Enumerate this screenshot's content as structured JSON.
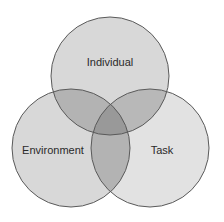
{
  "diagram": {
    "type": "venn",
    "sets": [
      {
        "id": "individual",
        "label": "Individual",
        "cx": 110,
        "cy": 76,
        "r": 59,
        "label_x": 110,
        "label_y": 66
      },
      {
        "id": "environment",
        "label": "Environment",
        "cx": 71,
        "cy": 148,
        "r": 59,
        "label_x": 53,
        "label_y": 154
      },
      {
        "id": "task",
        "label": "Task",
        "cx": 150,
        "cy": 148,
        "r": 59,
        "label_x": 162,
        "label_y": 154
      }
    ],
    "colors": {
      "single_fill": "#d8d8d8",
      "pair_fill": "#b3b3b3",
      "triple_fill": "#999999",
      "stroke": "#5a5a5a",
      "label": "#2a2a2a",
      "background": "#ffffff"
    }
  }
}
